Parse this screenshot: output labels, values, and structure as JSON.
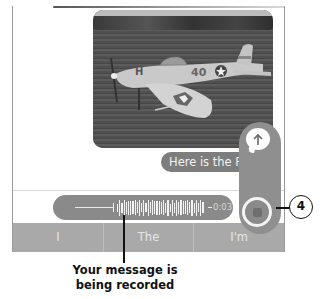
{
  "conversation": {
    "photo": {
      "description": "P-47 Thunderbolt model airplane on grass field",
      "nose_art": "H",
      "fuselage_number": "40"
    },
    "message_bubble": {
      "text": "Here is the P"
    },
    "delivered_status": "D"
  },
  "recording": {
    "timer": "0:03",
    "send_icon": "arrow-up-icon",
    "stop_icon": "stop-square-icon"
  },
  "keyboard": {
    "suggestions": [
      "I",
      "The",
      "I'm"
    ]
  },
  "annotations": {
    "callout_number": "4",
    "caption": "Your message is being recorded"
  },
  "colors": {
    "bubble": "#7d7d7d",
    "panel": "#8f8f8f",
    "suggestion_bar": "#a9a9a9",
    "waveform_pill": "#8a8a8a"
  }
}
